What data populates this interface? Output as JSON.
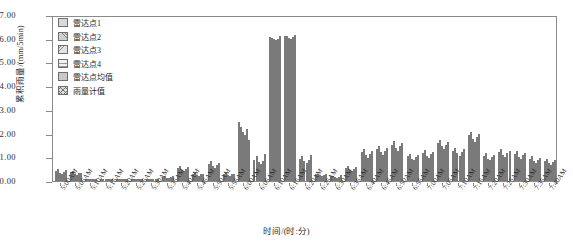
{
  "chart_data": {
    "type": "bar",
    "title": "",
    "xlabel": "时间/(时:分)",
    "ylabel": "累积雨量/(mm/5min)",
    "ylim": [
      0,
      7
    ],
    "yticks": [
      "0.00",
      "1.00",
      "2.00",
      "3.00",
      "4.00",
      "5.00",
      "6.00",
      "7.00"
    ],
    "grid": false,
    "legend_position": "top-left",
    "categories": [
      "5:00AM",
      "5:05AM",
      "5:10AM",
      "5:15AM",
      "5:20AM",
      "5:25AM",
      "5:30AM",
      "5:35AM",
      "5:40AM",
      "5:45AM",
      "5:50AM",
      "5:55AM",
      "6:00AM",
      "6:05AM",
      "6:10AM",
      "6:15AM",
      "6:20AM",
      "6:25AM",
      "6:30AM",
      "6:35AM",
      "6:40AM",
      "6:45AM",
      "6:50AM",
      "6:55AM",
      "7:00AM",
      "7:05AM",
      "7:10AM",
      "7:15AM",
      "7:20AM",
      "7:25AM",
      "7:30AM",
      "7:35AM",
      "7:40AM"
    ],
    "series": [
      {
        "name": "雷达点1",
        "values": [
          0.42,
          0.38,
          0.05,
          0.03,
          0.02,
          0.02,
          0.05,
          0.18,
          0.55,
          0.3,
          0.72,
          0.3,
          2.5,
          0.9,
          6.15,
          6.2,
          0.95,
          0.28,
          0.2,
          0.55,
          1.22,
          1.35,
          1.55,
          1.05,
          1.2,
          1.62,
          1.3,
          1.95,
          1.05,
          1.25,
          1.15,
          0.95,
          0.85
        ]
      },
      {
        "name": "雷达点2",
        "values": [
          0.5,
          0.42,
          0.06,
          0.03,
          0.02,
          0.03,
          0.06,
          0.22,
          0.62,
          0.35,
          0.85,
          0.35,
          2.3,
          1.05,
          6.1,
          6.18,
          1.05,
          0.32,
          0.22,
          0.62,
          1.35,
          1.5,
          1.7,
          1.15,
          1.32,
          1.75,
          1.42,
          2.1,
          1.18,
          1.38,
          1.28,
          1.05,
          0.95
        ]
      },
      {
        "name": "雷达点3",
        "values": [
          0.35,
          0.3,
          0.04,
          0.02,
          0.02,
          0.02,
          0.04,
          0.15,
          0.48,
          0.26,
          0.62,
          0.26,
          2.1,
          0.8,
          6.05,
          6.12,
          0.85,
          0.24,
          0.18,
          0.48,
          1.1,
          1.22,
          1.4,
          0.95,
          1.08,
          1.48,
          1.18,
          1.78,
          0.95,
          1.12,
          1.02,
          0.85,
          0.75
        ]
      },
      {
        "name": "雷达点4",
        "values": [
          0.3,
          0.26,
          0.04,
          0.02,
          0.01,
          0.02,
          0.04,
          0.12,
          0.42,
          0.22,
          0.55,
          0.22,
          1.95,
          0.72,
          6.0,
          6.08,
          0.78,
          0.2,
          0.15,
          0.42,
          1.0,
          1.12,
          1.28,
          0.88,
          1.0,
          1.35,
          1.08,
          1.65,
          0.88,
          1.02,
          0.92,
          0.78,
          0.68
        ]
      },
      {
        "name": "雷达点均值",
        "values": [
          0.39,
          0.34,
          0.05,
          0.03,
          0.02,
          0.02,
          0.05,
          0.17,
          0.52,
          0.28,
          0.68,
          0.28,
          2.21,
          0.87,
          6.08,
          6.15,
          0.91,
          0.26,
          0.19,
          0.52,
          1.17,
          1.3,
          1.48,
          1.01,
          1.15,
          1.55,
          1.25,
          1.87,
          1.02,
          1.19,
          1.09,
          0.91,
          0.81
        ]
      },
      {
        "name": "雨量计值",
        "values": [
          0.45,
          0.35,
          0.05,
          0.02,
          0.02,
          0.02,
          0.05,
          0.2,
          0.58,
          0.32,
          0.78,
          0.32,
          1.75,
          1.15,
          6.2,
          6.22,
          1.1,
          0.3,
          0.25,
          0.58,
          1.28,
          1.42,
          1.62,
          1.1,
          1.25,
          1.68,
          1.35,
          2.02,
          1.12,
          1.3,
          1.2,
          1.0,
          0.9
        ]
      }
    ]
  },
  "legend": {
    "items": [
      {
        "label": "雷达点1"
      },
      {
        "label": "雷达点2"
      },
      {
        "label": "雷达点3"
      },
      {
        "label": "雷达点4"
      },
      {
        "label": "雷达点均值"
      },
      {
        "label": "雨量计值"
      }
    ]
  }
}
